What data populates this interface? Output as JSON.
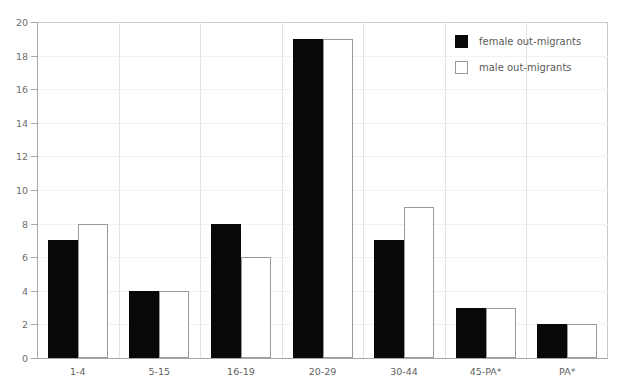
{
  "chart_data": {
    "type": "bar",
    "title": "",
    "xlabel": "",
    "ylabel": "",
    "ylim": [
      0,
      20
    ],
    "ytick_step": 2,
    "yticks": [
      "20",
      "18",
      "16",
      "14",
      "12",
      "10",
      "8",
      "6",
      "4",
      "2",
      "0"
    ],
    "grid": true,
    "legend_position": "top-right",
    "categories": [
      "1-4",
      "5-15",
      "16-19",
      "20-29",
      "30-44",
      "45-PA*",
      "PA*"
    ],
    "series": [
      {
        "name": "female out-migrants",
        "color": "#080808",
        "values": [
          7,
          4,
          8,
          19,
          7,
          3,
          2
        ]
      },
      {
        "name": "male out-migrants",
        "color": "#ffffff",
        "values": [
          8,
          4,
          6,
          19,
          9,
          3,
          2
        ]
      }
    ]
  },
  "legend": {
    "items": [
      {
        "label": "female out-migrants",
        "swatch": "filled-black-square"
      },
      {
        "label": "male out-migrants",
        "swatch": "outlined-white-square"
      }
    ]
  },
  "colors": {
    "female_bar": "#080808",
    "male_bar_fill": "#ffffff",
    "male_bar_stroke": "#9a9a9a",
    "axis": "#a9a9a9",
    "gridline": "#f2f2f2",
    "text": "#5b5b5b",
    "background": "#ffffff"
  }
}
